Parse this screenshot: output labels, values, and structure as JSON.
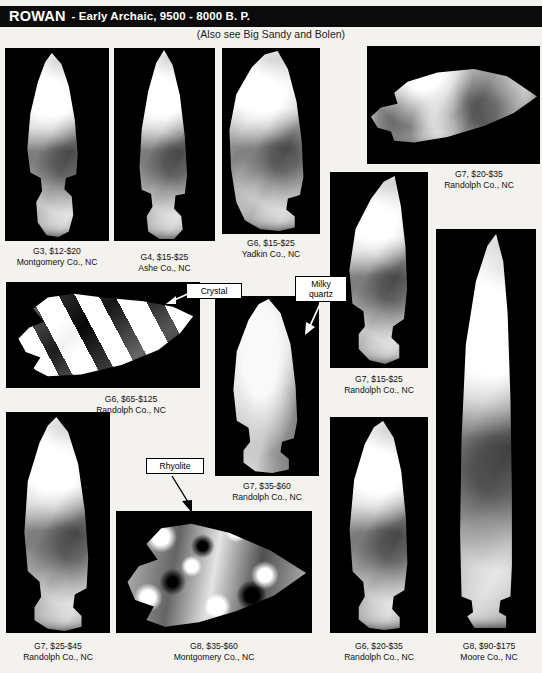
{
  "header": {
    "type_name": "ROWAN",
    "period": "- Early Archaic, 9500 - 8000 B. P.",
    "subtitle": "(Also see Big Sandy and Bolen)",
    "band_color": "#0b0b0b",
    "text_color": "#ffffff"
  },
  "callouts": [
    {
      "label": "Crystal"
    },
    {
      "label": "Milky\nquartz",
      "line1": "Milky",
      "line2": "quartz"
    },
    {
      "label": "Rhyolite"
    }
  ],
  "specimens": [
    {
      "id": "g3-montgomery",
      "grade_price": "G3, $12-$20",
      "provenance": "Montgomery Co., NC",
      "material": "stone",
      "orientation": "vertical"
    },
    {
      "id": "g4-ashe",
      "grade_price": "G4, $15-$25",
      "provenance": "Ashe Co., NC",
      "material": "stone",
      "orientation": "vertical"
    },
    {
      "id": "g6-yadkin",
      "grade_price": "G6, $15-$25",
      "provenance": "Yadkin Co., NC",
      "material": "stone",
      "orientation": "vertical"
    },
    {
      "id": "g7-randolph-20-35",
      "grade_price": "G7, $20-$35",
      "provenance": "Randolph Co., NC",
      "material": "stone",
      "orientation": "horizontal"
    },
    {
      "id": "g6-randolph-65-125",
      "grade_price": "G6, $65-$125",
      "provenance": "Randolph Co., NC",
      "material": "crystal",
      "orientation": "horizontal"
    },
    {
      "id": "g7-randolph-15-25",
      "grade_price": "G7, $15-$25",
      "provenance": "Randolph Co., NC",
      "material": "stone",
      "orientation": "vertical"
    },
    {
      "id": "g7-randolph-35-60",
      "grade_price": "G7, $35-$60",
      "provenance": "Randolph Co., NC",
      "material": "milky quartz",
      "orientation": "vertical"
    },
    {
      "id": "g7-randolph-25-45",
      "grade_price": "G7, $25-$45",
      "provenance": "Randolph Co., NC",
      "material": "stone",
      "orientation": "vertical"
    },
    {
      "id": "g8-montgomery-35-60",
      "grade_price": "G8, $35-$60",
      "provenance": "Montgomery Co., NC",
      "material": "rhyolite",
      "orientation": "horizontal"
    },
    {
      "id": "g6-randolph-20-35",
      "grade_price": "G6, $20-$35",
      "provenance": "Randolph Co., NC",
      "material": "stone",
      "orientation": "vertical"
    },
    {
      "id": "g8-moore-90-175",
      "grade_price": "G8, $90-$175",
      "provenance": "Moore Co., NC",
      "material": "stone",
      "orientation": "vertical"
    }
  ]
}
